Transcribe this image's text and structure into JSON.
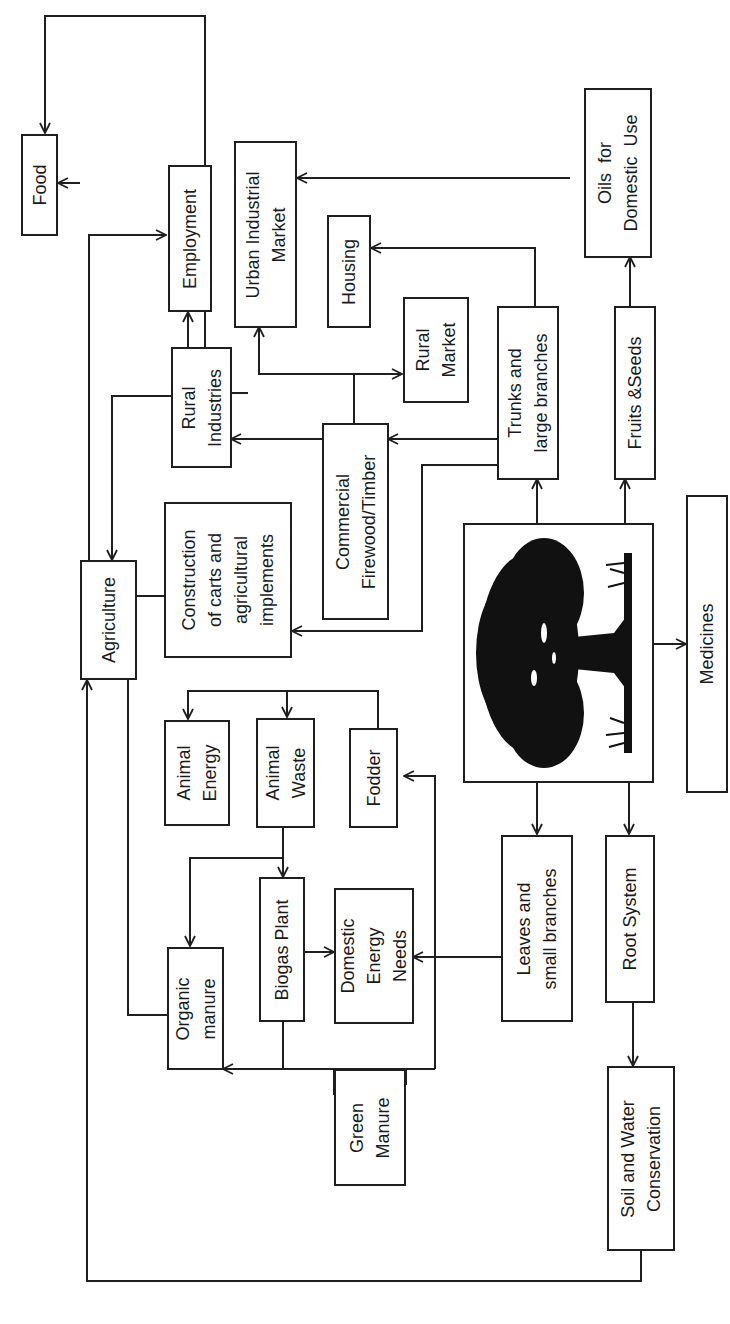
{
  "diagram": {
    "orientation": "rotated-90-ccw",
    "center_image": "tree-illustration",
    "nodes": {
      "food": "Food",
      "agriculture": "Agriculture",
      "employment": "Employment",
      "urban_industrial_market": "Urban Industrial\nMarket",
      "housing": "Housing",
      "oils_for_domestic_use": "Oils  for\nDomestic  Use",
      "rural_industries": "Rural\nIndustries",
      "rural_market": "Rural\nMarket",
      "trunks_and_large_branches": "Trunks and\nlarge branches",
      "fruits_and_seeds": "Fruits &Seeds",
      "construction_of_carts": "Construction\nof carts and\nagricultural\nimplements",
      "commercial_firewood_timber": "Commercial\nFirewood/Timber",
      "medicines": "Medicines",
      "animal_energy": "Animal\nEnergy",
      "animal_waste": "Animal\nWaste",
      "fodder": "Fodder",
      "organic_manure": "Organic\nmanure",
      "biogas_plant": "Biogas Plant",
      "domestic_energy_needs": "Domestic\nEnergy\nNeeds",
      "leaves_and_small_branches": "Leaves and\nsmall branches",
      "root_system": "Root System",
      "green_manure": "Green\nManure",
      "soil_and_water_conservation": "Soil and Water\nConservation"
    },
    "edges": [
      [
        "Tree",
        "Trunks and large branches"
      ],
      [
        "Tree",
        "Fruits & Seeds"
      ],
      [
        "Tree",
        "Medicines"
      ],
      [
        "Tree",
        "Leaves and small branches"
      ],
      [
        "Tree",
        "Root System"
      ],
      [
        "Trunks and large branches",
        "Commercial Firewood/Timber"
      ],
      [
        "Trunks and large branches",
        "Housing"
      ],
      [
        "Trunks and large branches",
        "Construction of carts and agricultural implements"
      ],
      [
        "Commercial Firewood/Timber",
        "Rural Industries"
      ],
      [
        "Commercial Firewood/Timber",
        "Urban Industrial Market"
      ],
      [
        "Commercial Firewood/Timber",
        "Rural Market"
      ],
      [
        "Rural Industries",
        "Employment"
      ],
      [
        "Rural Industries",
        "Agriculture"
      ],
      [
        "Agriculture",
        "Employment"
      ],
      [
        "Agriculture",
        "Food"
      ],
      [
        "Construction of carts and agricultural implements",
        "Agriculture"
      ],
      [
        "Fruits & Seeds",
        "Oils for Domestic Use"
      ],
      [
        "Fruits & Seeds",
        "Urban Industrial Market"
      ],
      [
        "Fruits & Seeds",
        "Food"
      ],
      [
        "Fodder",
        "Animal Energy"
      ],
      [
        "Fodder",
        "Animal Waste"
      ],
      [
        "Animal Waste",
        "Biogas Plant"
      ],
      [
        "Animal Waste",
        "Organic manure"
      ],
      [
        "Biogas Plant",
        "Domestic Energy Needs"
      ],
      [
        "Biogas Plant",
        "Organic manure"
      ],
      [
        "Leaves and small branches",
        "Domestic Energy Needs"
      ],
      [
        "Leaves and small branches",
        "Fodder"
      ],
      [
        "Leaves and small branches",
        "Green Manure"
      ],
      [
        "Organic manure",
        "Agriculture"
      ],
      [
        "Root System",
        "Soil and Water Conservation"
      ],
      [
        "Soil and Water Conservation",
        "Agriculture"
      ]
    ]
  }
}
